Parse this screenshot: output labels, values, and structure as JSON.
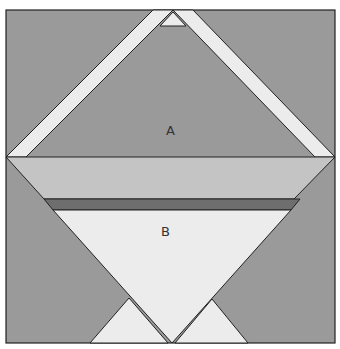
{
  "diagram": {
    "type": "quilt-block-pattern",
    "labels": {
      "a": "A",
      "b": "B"
    },
    "colors": {
      "background": "#ffffff",
      "medium_gray": "#9a9a9a",
      "light_band": "#c4c4c4",
      "dark_strip": "#6e6e6e",
      "pale": "#ececec",
      "outline": "#222222"
    }
  }
}
